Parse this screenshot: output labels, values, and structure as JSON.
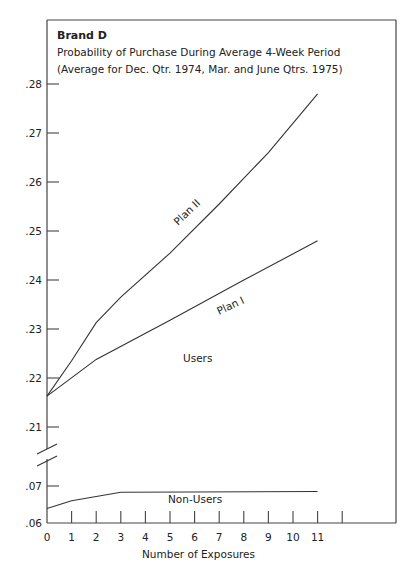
{
  "chart_data": {
    "type": "line",
    "title": "Brand D",
    "subtitle_lines": [
      "Probability of Purchase During Average 4-Week Period",
      "(Average for Dec. Qtr. 1974, Mar. and June Qtrs. 1975)"
    ],
    "xlabel": "Number of Exposures",
    "ylabel": "",
    "x_ticks": [
      0,
      1,
      2,
      3,
      4,
      5,
      6,
      7,
      8,
      9,
      10,
      11,
      12
    ],
    "x_tick_labels": [
      "0",
      "1",
      "2",
      "3",
      "4",
      "5",
      "6",
      "7",
      "8",
      "9",
      "10",
      "11",
      ""
    ],
    "y_ticks_upper": [
      ".21",
      ".22",
      ".23",
      ".24",
      ".25",
      ".26",
      ".27",
      ".28"
    ],
    "y_ticks_lower": [
      ".06",
      ".07"
    ],
    "ylim_upper": [
      0.205,
      0.2875
    ],
    "ylim_lower": [
      0.06,
      0.0725
    ],
    "axis_break": true,
    "grid": false,
    "series": [
      {
        "name": "Plan II",
        "group": "Users",
        "x": [
          0,
          1,
          2,
          3,
          5,
          7,
          9,
          11
        ],
        "values": [
          0.2163,
          0.2235,
          0.2313,
          0.2365,
          0.2455,
          0.2555,
          0.266,
          0.278
        ]
      },
      {
        "name": "Plan I",
        "group": "Users",
        "x": [
          0,
          2,
          5,
          8,
          11
        ],
        "values": [
          0.2163,
          0.2238,
          0.2318,
          0.24,
          0.248
        ]
      },
      {
        "name": "Non-Users",
        "group": "Non-Users",
        "x": [
          0,
          1,
          3,
          11
        ],
        "values": [
          0.0639,
          0.066,
          0.0683,
          0.0685
        ]
      }
    ],
    "annotations": [
      "Plan II",
      "Plan I",
      "Users",
      "Non-Users"
    ]
  },
  "labels": {
    "title": "Brand D",
    "subtitle1": "Probability of Purchase During Average 4-Week Period",
    "subtitle2": "(Average for Dec. Qtr. 1974, Mar. and June Qtrs. 1975)",
    "plan2": "Plan II",
    "plan1": "Plan I",
    "users": "Users",
    "nonusers": "Non-Users",
    "xlabel": "Number of Exposures"
  },
  "colors": {
    "line": "#333333",
    "text": "#222222"
  }
}
